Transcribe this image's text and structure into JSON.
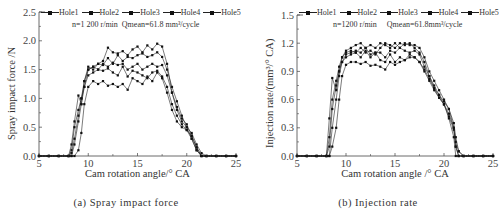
{
  "panels": [
    {
      "caption": "(a) Spray impact force",
      "xlabel": "Cam rotation angle/° CA",
      "ylabel": "Spray impact force /N",
      "condition_n": "n=1 200 r/min",
      "condition_q": "Qmean=61.8 mm³/cycle",
      "legend": [
        "Hole1",
        "Hole2",
        "Hole3",
        "Hole4",
        "Hole5"
      ]
    },
    {
      "caption": "(b) Injection rate",
      "xlabel": "Cam rotation angle /° CA",
      "ylabel": "Injection rate/(mm³/° CA)",
      "condition_n": "n=1200 r/min",
      "condition_q": "Qmean=61.8mm³/cycle",
      "legend": [
        "Hole1",
        "Hole2",
        "Hole3",
        "Hole4",
        "Hole5"
      ]
    }
  ],
  "chart_data": [
    {
      "type": "line",
      "title": "(a) Spray impact force",
      "xlabel": "Cam rotation angle/° CA",
      "ylabel": "Spray impact force /N",
      "xlim": [
        5,
        25
      ],
      "ylim": [
        0,
        2.5
      ],
      "xticks": [
        5,
        10,
        15,
        20,
        25
      ],
      "yticks": [
        0.0,
        0.5,
        1.0,
        1.5,
        2.0,
        2.5
      ],
      "annotation": "n=1 200 r/min  Qmean=61.8 mm³/cycle",
      "legend_position": "top",
      "plot_px": {
        "x0": 39,
        "x1": 236,
        "y0": 156,
        "y1": 12
      },
      "x": [
        5,
        6,
        7,
        8,
        8.3,
        8.6,
        9,
        9.3,
        9.6,
        10,
        10.5,
        11,
        11.5,
        12,
        12.5,
        13,
        13.5,
        14,
        14.5,
        15,
        15.5,
        16,
        16.5,
        17,
        17.5,
        18,
        18.5,
        19,
        19.5,
        20,
        20.5,
        21,
        21.5,
        22,
        23,
        24,
        25
      ],
      "series": [
        {
          "name": "Hole1",
          "values": [
            0,
            0,
            0,
            0,
            0.2,
            0.6,
            1.05,
            0.9,
            1.3,
            1.55,
            1.5,
            1.6,
            1.58,
            1.7,
            1.6,
            1.75,
            1.65,
            1.72,
            1.7,
            1.75,
            1.78,
            1.72,
            1.75,
            1.8,
            1.72,
            1.5,
            1.2,
            0.95,
            0.7,
            0.5,
            0.3,
            0.1,
            0,
            0,
            0,
            0,
            0
          ]
        },
        {
          "name": "Hole2",
          "values": [
            0,
            0,
            0,
            0,
            0.1,
            0.5,
            0.8,
            1.0,
            1.2,
            1.5,
            1.55,
            1.6,
            1.65,
            1.88,
            1.8,
            1.78,
            1.82,
            1.75,
            1.85,
            1.9,
            1.8,
            1.92,
            1.85,
            1.95,
            1.9,
            1.6,
            1.1,
            0.85,
            0.65,
            0.55,
            0.35,
            0.15,
            0,
            0,
            0,
            0,
            0
          ]
        },
        {
          "name": "Hole3",
          "values": [
            0,
            0,
            0,
            0,
            0.05,
            0.3,
            0.7,
            1.0,
            1.3,
            1.5,
            1.55,
            1.5,
            1.6,
            1.55,
            1.62,
            1.58,
            1.6,
            1.5,
            1.55,
            1.6,
            1.5,
            1.55,
            1.6,
            1.55,
            1.58,
            1.4,
            1.1,
            0.8,
            0.6,
            0.5,
            0.4,
            0.2,
            0.05,
            0,
            0,
            0,
            0
          ]
        },
        {
          "name": "Hole4",
          "values": [
            0,
            0,
            0,
            0,
            0,
            0.2,
            0.6,
            0.9,
            1.2,
            1.4,
            1.45,
            1.5,
            1.48,
            1.52,
            1.45,
            1.4,
            1.55,
            1.38,
            1.48,
            1.45,
            1.4,
            1.35,
            1.45,
            1.48,
            1.38,
            1.2,
            0.9,
            0.7,
            0.55,
            0.45,
            0.35,
            0.15,
            0,
            0,
            0,
            0,
            0
          ]
        },
        {
          "name": "Hole5",
          "values": [
            0,
            0,
            0,
            0,
            0,
            0,
            0.1,
            0.4,
            0.9,
            1.2,
            1.3,
            1.25,
            1.3,
            1.22,
            1.25,
            1.2,
            1.25,
            1.15,
            1.35,
            1.3,
            1.25,
            1.38,
            1.3,
            1.45,
            1.35,
            1.1,
            0.8,
            0.6,
            0.5,
            0.45,
            0.3,
            0.1,
            0,
            0,
            0,
            0,
            0
          ]
        }
      ]
    },
    {
      "type": "line",
      "title": "(b) Injection rate",
      "xlabel": "Cam rotation angle /° CA",
      "ylabel": "Injection rate/(mm³/° CA)",
      "xlim": [
        5,
        25
      ],
      "ylim": [
        0,
        1.5
      ],
      "xticks": [
        5,
        10,
        15,
        20,
        25
      ],
      "yticks": [
        0.0,
        0.3,
        0.6,
        0.9,
        1.2,
        1.5
      ],
      "annotation": "n=1200 r/min  Qmean=61.8mm³/cycle",
      "legend_position": "top",
      "plot_px": {
        "x0": 297,
        "x1": 493,
        "y0": 156,
        "y1": 15
      },
      "x": [
        5,
        6,
        7,
        8,
        8.3,
        8.6,
        9,
        9.3,
        9.6,
        10,
        10.5,
        11,
        11.5,
        12,
        12.5,
        13,
        13.5,
        14,
        14.5,
        15,
        15.5,
        16,
        16.5,
        17,
        17.5,
        18,
        18.5,
        19,
        19.5,
        20,
        20.5,
        21,
        21.2,
        21.5,
        22,
        23,
        24,
        25
      ],
      "series": [
        {
          "name": "Hole1",
          "values": [
            0,
            0,
            0,
            0,
            0.4,
            0.83,
            0.7,
            0.9,
            1.05,
            1.1,
            1.12,
            1.1,
            1.15,
            1.1,
            1.12,
            1.08,
            1.15,
            1.2,
            1.18,
            1.15,
            1.2,
            1.18,
            1.2,
            1.15,
            1.1,
            1.0,
            0.85,
            0.75,
            0.65,
            0.55,
            0.4,
            0.2,
            0,
            0,
            0,
            0,
            0,
            0
          ]
        },
        {
          "name": "Hole2",
          "values": [
            0,
            0,
            0,
            0,
            0.2,
            0.6,
            0.8,
            0.95,
            1.05,
            1.12,
            1.15,
            1.18,
            1.2,
            1.15,
            1.18,
            1.15,
            1.2,
            1.18,
            1.15,
            1.2,
            1.15,
            1.2,
            1.18,
            1.18,
            1.15,
            1.05,
            0.9,
            0.8,
            0.7,
            0.6,
            0.5,
            0.3,
            0.1,
            0,
            0,
            0,
            0,
            0
          ]
        },
        {
          "name": "Hole3",
          "values": [
            0,
            0,
            0,
            0,
            0.1,
            0.5,
            0.75,
            0.9,
            1.0,
            1.08,
            1.1,
            1.12,
            1.1,
            1.15,
            1.08,
            1.1,
            1.1,
            1.05,
            1.12,
            1.1,
            1.15,
            1.12,
            1.1,
            1.12,
            1.08,
            0.95,
            0.85,
            0.72,
            0.62,
            0.55,
            0.42,
            0.28,
            0.1,
            0,
            0,
            0,
            0,
            0
          ]
        },
        {
          "name": "Hole4",
          "values": [
            0,
            0,
            0,
            0,
            0,
            0.3,
            0.6,
            0.85,
            1.0,
            1.05,
            1.08,
            1.1,
            1.05,
            1.12,
            1.05,
            1.1,
            1.02,
            1.0,
            1.08,
            1.0,
            1.05,
            1.02,
            1.08,
            1.05,
            1.0,
            0.9,
            0.8,
            0.7,
            0.62,
            0.55,
            0.45,
            0.3,
            0.15,
            0.05,
            0,
            0,
            0,
            0
          ]
        },
        {
          "name": "Hole5",
          "values": [
            0,
            0,
            0,
            0,
            0,
            0.1,
            0.3,
            0.6,
            0.85,
            0.97,
            1.0,
            1.0,
            0.98,
            1.0,
            0.96,
            0.97,
            0.95,
            0.92,
            1.0,
            0.97,
            1.0,
            1.02,
            1.05,
            1.05,
            1.0,
            0.92,
            0.82,
            0.72,
            0.65,
            0.58,
            0.5,
            0.35,
            0.2,
            0.05,
            0,
            0,
            0,
            0
          ]
        }
      ]
    }
  ]
}
